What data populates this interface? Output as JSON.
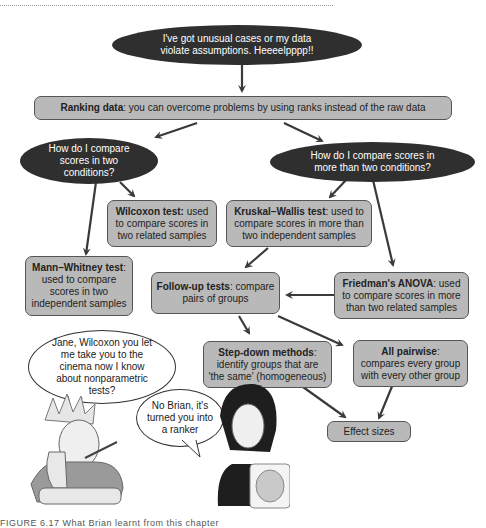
{
  "figure": {
    "caption": "FIGURE 6.17   What Brian learnt from this chapter"
  },
  "nodes": {
    "start_cloud": "I've got unusual cases or my data violate assumptions. Heeeelpppp!!",
    "ranking": {
      "bold": "Ranking data",
      "text": ": you can overcome problems by using ranks instead of the raw data"
    },
    "two_conditions_cloud": "How do I compare scores in two conditions?",
    "more_conditions_cloud": "How do I compare scores in more than two conditions?",
    "wilcoxon": {
      "bold": "Wilcoxon test:",
      "text": " used to compare scores in two related samples"
    },
    "kruskal": {
      "bold": "Kruskal–Wallis test",
      "text": ": used to compare scores in more than two independent samples"
    },
    "mann_whitney": {
      "bold": "Mann–Whitney test",
      "text": ": used to compare scores in two independent samples"
    },
    "follow_up": {
      "bold": "Follow-up tests",
      "text": ": compare pairs of groups"
    },
    "friedman": {
      "bold": "Friedman's ANOVA",
      "text": ": used to compare scores in more than two related samples"
    },
    "step_down": {
      "bold": "Step-down methods",
      "text": ": identify groups that are 'the same' (homogeneous)"
    },
    "all_pairwise": {
      "bold": "All pairwise",
      "text": ": compares every group with every other group"
    },
    "effect_sizes": "Effect sizes"
  },
  "speech": {
    "brian": "Jane, Wilcoxon you let me take you to the cinema now I know about nonparametric tests?",
    "jane": "No Brian, it's turned you into a ranker"
  },
  "colors": {
    "cloud": "#2f2f2f",
    "box_fill": "#b9b9b9",
    "box_border": "#555555",
    "arrow": "#3a3a3a"
  }
}
